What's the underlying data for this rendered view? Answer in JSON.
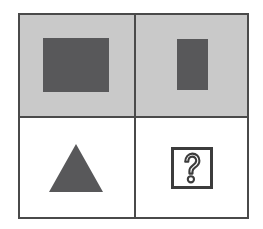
{
  "figure": {
    "type": "2x2-matrix",
    "rows": 2,
    "columns": 2,
    "colors": {
      "frame_line": "#4a4a4a",
      "shaded_cell_background": "#c9c9c9",
      "plain_cell_background": "#ffffff",
      "shape_fill": "#58585a",
      "answer_box_outline": "#3c3c3c",
      "page_background": "#ffffff"
    },
    "cells": [
      {
        "position": "top-left",
        "background": "shaded",
        "shape": "square",
        "shape_label": "large dark square",
        "shape_fill": "#58585a",
        "width_px": 66,
        "height_px": 54
      },
      {
        "position": "top-right",
        "background": "shaded",
        "shape": "rectangle",
        "shape_label": "small dark vertical rectangle",
        "shape_fill": "#58585a",
        "width_px": 31,
        "height_px": 51
      },
      {
        "position": "bottom-left",
        "background": "plain",
        "shape": "triangle",
        "shape_label": "dark triangle",
        "shape_fill": "#58585a",
        "width_px": 54,
        "height_px": 48
      },
      {
        "position": "bottom-right",
        "background": "plain",
        "shape": "question-mark-box",
        "shape_label": "missing answer",
        "glyph": "?",
        "width_px": 42,
        "height_px": 42
      }
    ]
  }
}
